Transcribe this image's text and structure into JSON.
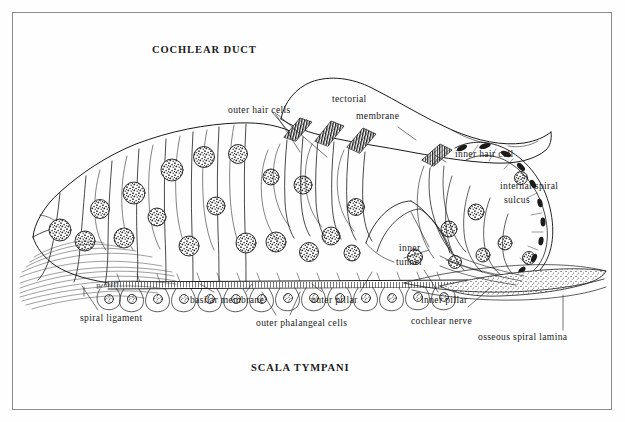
{
  "figure": {
    "background_color": "#fefefe",
    "ink_color": "#1b1b1b",
    "border_color": "#8a8a8a"
  },
  "headings": {
    "top": "COCHLEAR DUCT",
    "bottom": "SCALA TYMPANI"
  },
  "labels": {
    "outer_hair_cells": "outer hair cells",
    "tectorial": "tectorial",
    "membrane": "membrane",
    "inner_hair_cell": "inner hair cell",
    "internal_spiral": "internal spiral",
    "sulcus": "sulcus",
    "inner": "inner",
    "tunnel": "tunnel",
    "basilar_membrane": "basilar membrane",
    "outer_pillar": "outer pillar",
    "inner_pillar": "inner pillar",
    "cochlear_nerve": "cochlear nerve",
    "outer_phalangeal_cells": "outer phalangeal cells",
    "spiral_ligament": "spiral ligament",
    "osseous_spiral_lamina": "osseous spiral lamina",
    "signature": "Benkzer"
  }
}
